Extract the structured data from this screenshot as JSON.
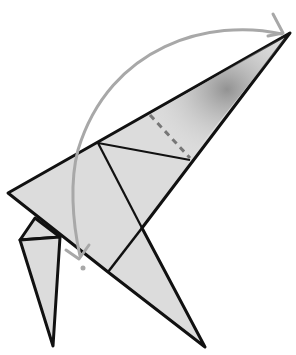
{
  "diagram": {
    "type": "origami-fold-step",
    "colors": {
      "paper_fill": "#dcdcdc",
      "outline": "#111111",
      "arrow": "#a8a8a8",
      "shade": "#8a8a8a"
    },
    "arrow": {
      "kind": "valley-fold-arrow",
      "direction": "from top-right tip curving down to left"
    },
    "fold_line": {
      "kind": "dashed",
      "label": "valley-fold-line"
    }
  }
}
